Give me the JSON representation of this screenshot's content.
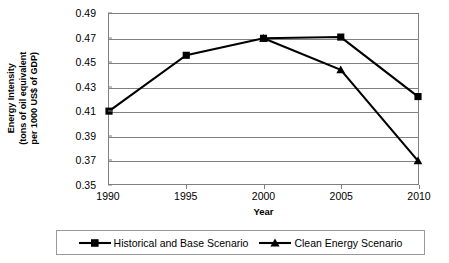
{
  "chart_data": {
    "type": "line",
    "title": "",
    "xlabel": "Year",
    "ylabel": "Energy Intensity (tons of oil equivalent per 1000 US$ of GDP)",
    "ylabel_lines": [
      "Energy Intensity",
      "(tons of oil equivalent",
      "per 1000 US$ of GDP)"
    ],
    "categories": [
      "1990",
      "1995",
      "2000",
      "2005",
      "2010"
    ],
    "x": [
      1990,
      1995,
      2000,
      2005,
      2010
    ],
    "xlim": [
      1990,
      2010
    ],
    "ylim": [
      0.35,
      0.49
    ],
    "ytick_labels": [
      "0.49",
      "0.47",
      "0.45",
      "0.43",
      "0.41",
      "0.39",
      "0.37",
      "0.35"
    ],
    "yticks": [
      0.49,
      0.47,
      0.45,
      0.43,
      0.41,
      0.39,
      0.37,
      0.35
    ],
    "grid": true,
    "legend_position": "bottom",
    "series": [
      {
        "name": "Historical and Base Scenario",
        "marker": "square",
        "color": "#000000",
        "values": [
          0.41,
          0.456,
          0.47,
          0.471,
          0.422
        ]
      },
      {
        "name": "Clean Energy Scenario",
        "marker": "triangle",
        "color": "#000000",
        "values": [
          null,
          null,
          0.47,
          0.444,
          0.369
        ]
      }
    ]
  },
  "axes": {
    "y_title_lines": [
      "Energy Intensity",
      "(tons of oil equivalent",
      "per 1000 US$ of GDP)"
    ],
    "x_title": "Year"
  },
  "legend": {
    "entries": [
      {
        "label": "Historical and Base Scenario",
        "marker": "square-marker"
      },
      {
        "label": "Clean Energy Scenario",
        "marker": "triangle-marker"
      }
    ]
  }
}
